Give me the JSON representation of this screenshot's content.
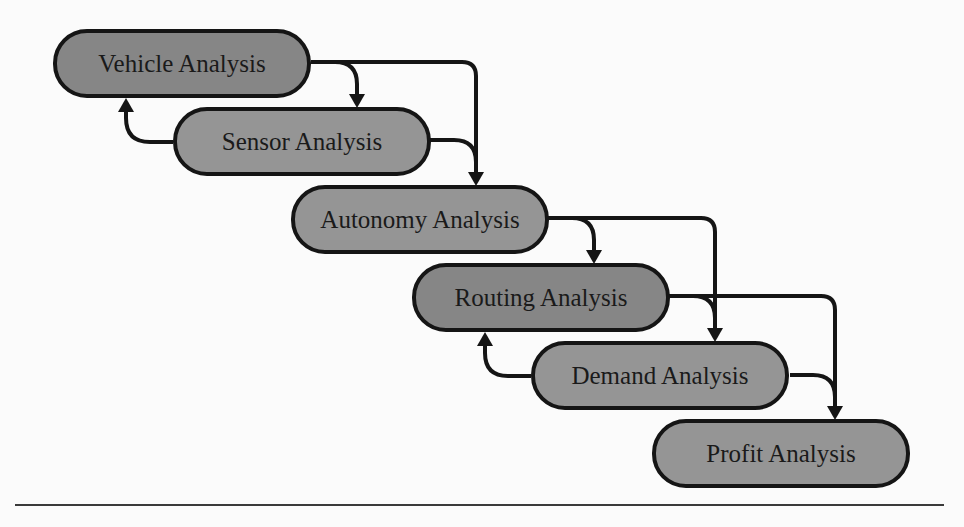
{
  "diagram": {
    "type": "flowchart",
    "nodes": [
      {
        "id": "vehicle",
        "label": "Vehicle Analysis",
        "shade": "dark"
      },
      {
        "id": "sensor",
        "label": "Sensor Analysis",
        "shade": "light"
      },
      {
        "id": "autonomy",
        "label": "Autonomy Analysis",
        "shade": "light"
      },
      {
        "id": "routing",
        "label": "Routing Analysis",
        "shade": "dark"
      },
      {
        "id": "demand",
        "label": "Demand Analysis",
        "shade": "light"
      },
      {
        "id": "profit",
        "label": "Profit Analysis",
        "shade": "light"
      }
    ],
    "edges": [
      {
        "from": "vehicle",
        "to": "sensor"
      },
      {
        "from": "vehicle",
        "to": "autonomy"
      },
      {
        "from": "sensor",
        "to": "autonomy"
      },
      {
        "from": "sensor",
        "to": "vehicle"
      },
      {
        "from": "autonomy",
        "to": "routing"
      },
      {
        "from": "autonomy",
        "to": "demand"
      },
      {
        "from": "routing",
        "to": "demand"
      },
      {
        "from": "routing",
        "to": "profit"
      },
      {
        "from": "demand",
        "to": "profit"
      },
      {
        "from": "demand",
        "to": "routing"
      }
    ],
    "colors": {
      "dark_fill": "#868686",
      "light_fill": "#959595",
      "stroke": "#151515"
    }
  }
}
